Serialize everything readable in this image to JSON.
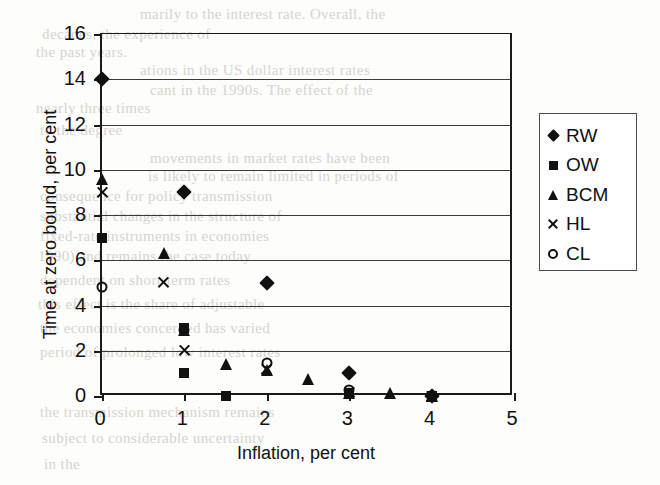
{
  "chart_data": {
    "type": "scatter",
    "title": "",
    "xlabel": "Inflation, per cent",
    "ylabel": "Time at zero bound, per cent",
    "xlim": [
      0,
      5
    ],
    "ylim": [
      0,
      16
    ],
    "xticks": [
      0,
      1,
      2,
      3,
      4,
      5
    ],
    "yticks": [
      0,
      2,
      4,
      6,
      8,
      10,
      12,
      14,
      16
    ],
    "grid": "horizontal",
    "legend_position": "right-outside",
    "series": [
      {
        "name": "RW",
        "marker": "filled-diamond",
        "points": [
          [
            0,
            14.0
          ],
          [
            1,
            9.0
          ],
          [
            2,
            5.0
          ],
          [
            3,
            1.0
          ],
          [
            4,
            0.0
          ]
        ]
      },
      {
        "name": "OW",
        "marker": "filled-square",
        "points": [
          [
            0,
            7.0
          ],
          [
            1,
            3.0
          ],
          [
            1,
            1.0
          ],
          [
            1.5,
            0.0
          ],
          [
            3,
            0.15
          ],
          [
            4,
            0.0
          ]
        ]
      },
      {
        "name": "BCM",
        "marker": "filled-triangle",
        "points": [
          [
            0,
            9.6
          ],
          [
            0.75,
            6.3
          ],
          [
            1,
            2.9
          ],
          [
            1.5,
            1.4
          ],
          [
            2,
            1.15
          ],
          [
            2.5,
            0.75
          ],
          [
            3,
            0.15
          ],
          [
            3.5,
            0.15
          ],
          [
            4,
            0.0
          ]
        ]
      },
      {
        "name": "HL",
        "marker": "cross",
        "points": [
          [
            0,
            9.0
          ],
          [
            0.75,
            5.0
          ],
          [
            1,
            2.0
          ],
          [
            2,
            1.15
          ],
          [
            3,
            0.15
          ],
          [
            4,
            0.0
          ]
        ]
      },
      {
        "name": "CL",
        "marker": "open-circle",
        "points": [
          [
            0,
            4.8
          ],
          [
            1,
            2.9
          ],
          [
            2,
            1.45
          ],
          [
            3,
            0.25
          ],
          [
            4,
            0.0
          ]
        ]
      }
    ]
  },
  "legend": {
    "entries": [
      {
        "label": "RW",
        "marker": "filled-diamond"
      },
      {
        "label": "OW",
        "marker": "filled-square"
      },
      {
        "label": "BCM",
        "marker": "filled-triangle"
      },
      {
        "label": "HL",
        "marker": "cross"
      },
      {
        "label": "CL",
        "marker": "open-circle"
      }
    ]
  },
  "background_text": {
    "lines": [
      {
        "text": "marily  to  the  interest rate.  Overall,  the",
        "x": 140,
        "y": 6
      },
      {
        "text": "decades, the experience of",
        "x": 42,
        "y": 26
      },
      {
        "text": "the past years.",
        "x": 36,
        "y": 44
      },
      {
        "text": "ations  in  the  US  dollar  interest  rates",
        "x": 140,
        "y": 62
      },
      {
        "text": "cant  in  the  1990s.  The  effect  of  the",
        "x": 150,
        "y": 82
      },
      {
        "text": "nearly  three  times",
        "x": 36,
        "y": 100
      },
      {
        "text": "to the degree",
        "x": 40,
        "y": 122
      },
      {
        "text": "movements  in  market  rates  have  been",
        "x": 150,
        "y": 150
      },
      {
        "text": "is  likely  to  remain  limited  in  periods of",
        "x": 148,
        "y": 168
      },
      {
        "text": "consequence  for  policy  transmission",
        "x": 40,
        "y": 188
      },
      {
        "text": "substantial  changes  in  the  structure  of",
        "x": 40,
        "y": 208
      },
      {
        "text": "fixed-rate  instruments  in  economies",
        "x": 40,
        "y": 228
      },
      {
        "text": "1990)  and  remains  the  case  today",
        "x": 38,
        "y": 248
      },
      {
        "text": "dependent  on  short-term  rates",
        "x": 40,
        "y": 272
      },
      {
        "text": "this  effect  is  the  share  of  adjustable",
        "x": 38,
        "y": 296
      },
      {
        "text": "the  economies  concerned  has  varied",
        "x": 40,
        "y": 320
      },
      {
        "text": "period  of  prolonged  low  interest  rates",
        "x": 40,
        "y": 344
      },
      {
        "text": "the  transmission  mechanism  remains",
        "x": 40,
        "y": 404
      },
      {
        "text": "subject  to  considerable  uncertainty",
        "x": 42,
        "y": 430
      },
      {
        "text": "in  the",
        "x": 44,
        "y": 456
      }
    ]
  }
}
